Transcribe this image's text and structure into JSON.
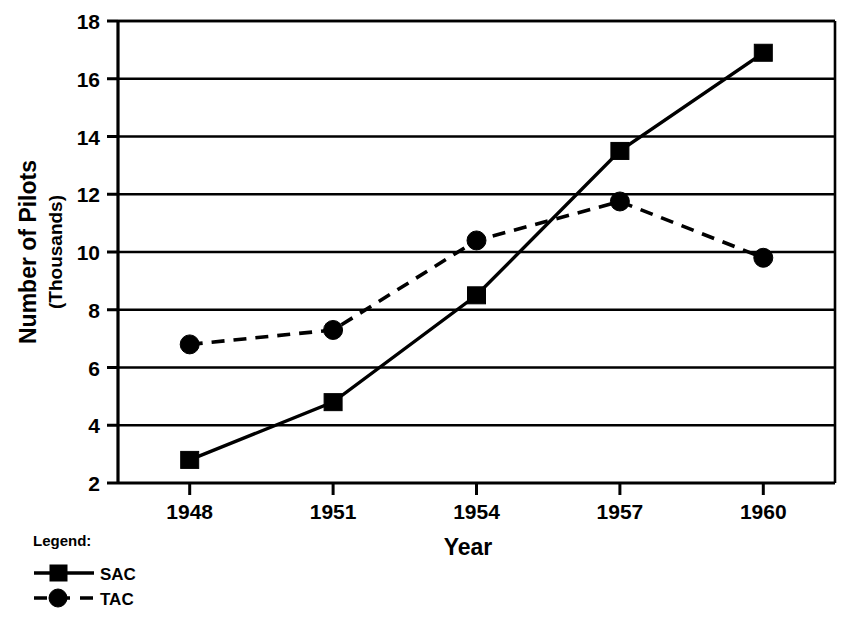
{
  "chart_data": {
    "type": "line",
    "title": "",
    "xlabel": "Year",
    "ylabel": "Number of Pilots\n(Thousands)",
    "ylabel_line1": "Number of Pilots",
    "ylabel_line2": "(Thousands)",
    "categories": [
      "1948",
      "1951",
      "1954",
      "1957",
      "1960"
    ],
    "x": [
      1948,
      1951,
      1954,
      1957,
      1960
    ],
    "xlim": [
      1946.5,
      1961.5
    ],
    "ylim": [
      2,
      18
    ],
    "yticks": [
      2,
      4,
      6,
      8,
      10,
      12,
      14,
      16,
      18
    ],
    "ytick_labels": [
      "2",
      "4",
      "6",
      "8",
      "10",
      "12",
      "14",
      "16",
      "18"
    ],
    "xtick_labels": [
      "1948",
      "1951",
      "1954",
      "1957",
      "1960"
    ],
    "grid": "horizontal",
    "legend_position": "below-left",
    "units": "Thousands of pilots",
    "series": [
      {
        "name": "SAC",
        "style": "solid",
        "marker": "square",
        "color": "#000000",
        "values": [
          2.8,
          4.8,
          8.5,
          13.5,
          16.9
        ]
      },
      {
        "name": "TAC",
        "style": "dashed",
        "marker": "circle",
        "color": "#000000",
        "values": [
          6.8,
          7.3,
          10.4,
          11.75,
          9.8
        ]
      }
    ]
  },
  "legend": {
    "title": "Legend:",
    "entries": [
      {
        "label": "SAC",
        "marker": "square",
        "line": "solid"
      },
      {
        "label": "TAC",
        "marker": "circle",
        "line": "dashed"
      }
    ]
  },
  "axes": {
    "x_title": "Year",
    "y_title_line1": "Number of Pilots",
    "y_title_line2": "(Thousands)"
  }
}
